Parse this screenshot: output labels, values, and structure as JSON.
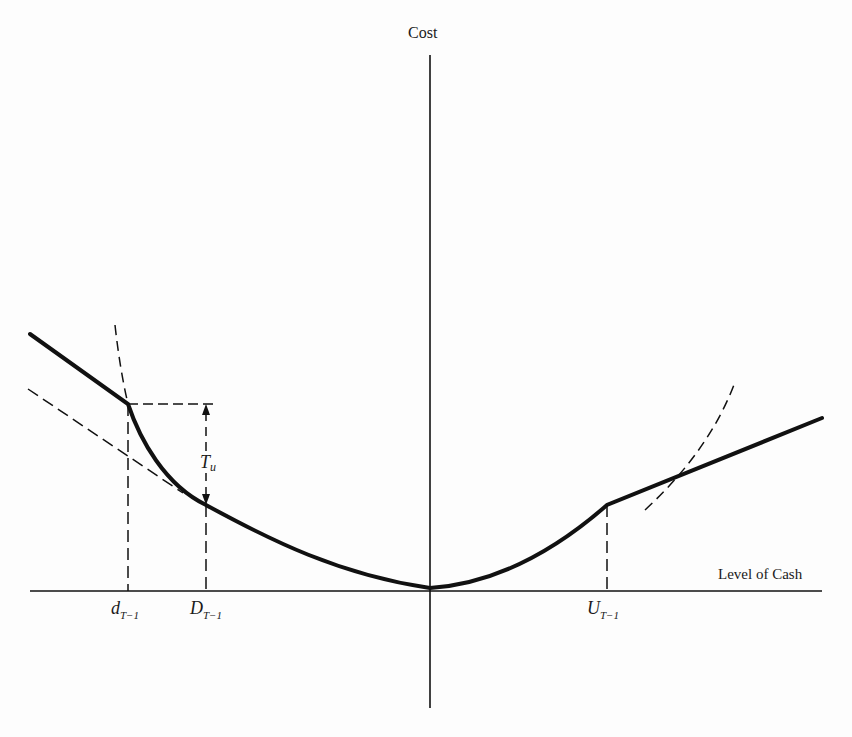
{
  "axes": {
    "y_label": "Cost",
    "x_label": "Level of Cash"
  },
  "labels": {
    "d": {
      "main": "d",
      "sub": "T−1"
    },
    "D": {
      "main": "D",
      "sub": "T−1"
    },
    "U": {
      "main": "U",
      "sub": "T−1"
    },
    "Tu": {
      "main": "T",
      "sub": "u"
    }
  },
  "colors": {
    "ink": "#111111",
    "background": "#fdfdfd"
  }
}
